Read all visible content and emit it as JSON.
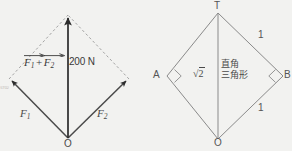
{
  "canvas": {
    "width": 292,
    "height": 151,
    "background": "#f2f2f0"
  },
  "colors": {
    "vector_solid": "#2b2b2b",
    "vector_dashed": "#9a9a9a",
    "geometry_stroke": "#8a8a8a",
    "text": "#4a4a4a",
    "watermark": "#b9b2ae"
  },
  "left_figure": {
    "name": "vector-parallelogram",
    "origin_label": "O",
    "resultant": {
      "magnitude_label": "200 N",
      "sum_label": {
        "first": "F",
        "first_sub": "1",
        "operator": "+",
        "second": "F",
        "second_sub": "2"
      }
    },
    "components": [
      {
        "label": "F",
        "sub": "1"
      },
      {
        "label": "F",
        "sub": "2"
      }
    ],
    "watermark_text": "ST02",
    "geometry": {
      "origin": [
        68,
        138
      ],
      "tip_f1": [
        9,
        79
      ],
      "tip_f2": [
        129,
        79
      ],
      "apex": [
        68,
        15
      ]
    }
  },
  "right_figure": {
    "name": "right-triangle-diamond",
    "vertices": {
      "top": "T",
      "left": "A",
      "right": "B",
      "bottom": "O"
    },
    "diagonal_label": {
      "radical": "√",
      "radicand": "2"
    },
    "annotation_lines": [
      "直角",
      "三角形"
    ],
    "edge_labels": {
      "top_right": "1",
      "bottom_right": "1"
    },
    "right_angle_markers": [
      "A",
      "B"
    ],
    "geometry": {
      "top": [
        218,
        13
      ],
      "left": [
        167,
        76
      ],
      "right": [
        283,
        76
      ],
      "bottom": [
        218,
        139
      ]
    }
  }
}
